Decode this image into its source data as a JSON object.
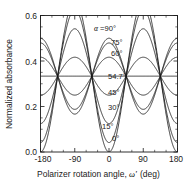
{
  "chart_data": {
    "type": "line",
    "title": "",
    "xlabel": "Polarizer rotation angle, ω' (deg)",
    "ylabel": "Normalized absorbance",
    "xlim": [
      -180,
      180
    ],
    "ylim": [
      0.0,
      0.6
    ],
    "xticks": [
      -180,
      -90,
      0,
      90,
      180
    ],
    "xticklabels": [
      "-180",
      "-90",
      "0",
      "90",
      "180"
    ],
    "yticks": [
      0.0,
      0.2,
      0.4,
      0.6
    ],
    "yticklabels": [
      "0.0",
      "0.2",
      "0.4",
      "0.6"
    ],
    "xminor_step": 30,
    "yminor_step": 0.05,
    "grid": false,
    "legend": "inline-annotations",
    "ticks_direction": "in",
    "ticks_all_sides": true,
    "crossing_value": 0.3333,
    "magic_angle": 54.7,
    "series": [
      {
        "name": "α=90°",
        "alpha_deg": 90,
        "baseline": 0.3333,
        "amplitude": 0.1667,
        "min": 0.1667,
        "max": 0.5,
        "annotation": "α=90°",
        "label_x_deg": -4,
        "label_y": 0.531
      },
      {
        "name": "75°",
        "alpha_deg": 75,
        "baseline": 0.3333,
        "amplitude": 0.1458,
        "min": 0.1875,
        "max": 0.479,
        "annotation": "75°",
        "label_x_deg": 13,
        "label_y": 0.466
      },
      {
        "name": "60°",
        "alpha_deg": 60,
        "baseline": 0.3333,
        "amplitude": 0.0833,
        "min": 0.25,
        "max": 0.4167,
        "annotation": "60°",
        "label_x_deg": 13,
        "label_y": 0.418
      },
      {
        "name": "54.7°",
        "alpha_deg": 54.7,
        "baseline": 0.3333,
        "amplitude": 0.0,
        "min": 0.3333,
        "max": 0.3333,
        "annotation": "54.7°",
        "label_x_deg": 11,
        "label_y": 0.318
      },
      {
        "name": "45°",
        "alpha_deg": 45,
        "baseline": 0.3333,
        "amplitude": -0.0833,
        "min": 0.25,
        "max": 0.4167,
        "annotation": "45°",
        "label_x_deg": 11,
        "label_y": 0.248
      },
      {
        "name": "30°",
        "alpha_deg": 30,
        "baseline": 0.3333,
        "amplitude": -0.2083,
        "min": 0.125,
        "max": 0.5417,
        "annotation": "30°",
        "label_x_deg": 11,
        "label_y": 0.181
      },
      {
        "name": "15°",
        "alpha_deg": 15,
        "baseline": 0.3333,
        "amplitude": -0.2917,
        "min": 0.0417,
        "max": 0.625,
        "annotation": "15°",
        "label_x_deg": 2,
        "label_y": 0.097
      },
      {
        "name": "0°",
        "alpha_deg": 0,
        "baseline": 0.3333,
        "amplitude": -0.3333,
        "min": 0.0,
        "max": 0.6667,
        "annotation": "0°",
        "label_x_deg": 14,
        "label_y": 0.043
      }
    ]
  },
  "axes": {
    "ylabel": "Normalized absorbance",
    "xlabel_prefix": "Polarizer rotation angle,",
    "xlabel_symbol": "ω'",
    "xlabel_suffix": "(deg)",
    "ytick_0": "0.0",
    "ytick_1": "0.2",
    "ytick_2": "0.4",
    "ytick_3": "0.6",
    "xtick_0": "-180",
    "xtick_1": "-90",
    "xtick_2": "0",
    "xtick_3": "90",
    "xtick_4": "180"
  },
  "annotations": {
    "a0_prefix": "α",
    "a0_rest": "=90°",
    "a1": "75°",
    "a2": "60°",
    "a3": "54.7°",
    "a4": "45°",
    "a5": "30°",
    "a6": "15°",
    "a7": "0°"
  },
  "colors": {
    "curve": "#1a1a1a",
    "axis": "#1a1a1a",
    "background": "#ffffff"
  }
}
